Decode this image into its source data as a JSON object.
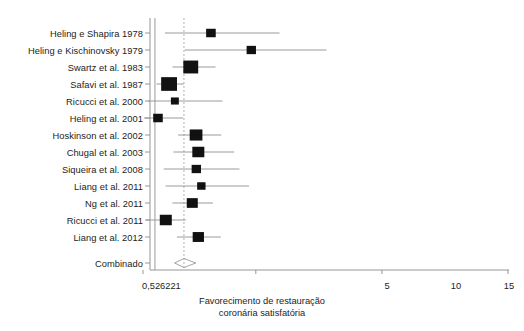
{
  "chart_data": {
    "type": "forest",
    "title": "",
    "xlabel": "Favorecimento de restauração coronária satisfatória",
    "ylabel": "",
    "xlim": [
      0.526221,
      15
    ],
    "xticks": [
      0.526221,
      5,
      10,
      15
    ],
    "xtick_labels": [
      "0,526221",
      "5",
      "10",
      "15"
    ],
    "grid": false,
    "legend": null,
    "null_line": 1,
    "summary_line": 2.15,
    "categories": [
      "Heling e Shapira 1978",
      "Heling e Kischinovsky 1979",
      "Swartz et al. 1983",
      "Safavi et al. 1987",
      "Ricucci et al. 2000",
      "Heling et al. 2001",
      "Hoskinson et al. 2002",
      "Chugal et al. 2003",
      "Siqueira et al. 2008",
      "Liang et al. 2011",
      "Ng et al. 2011",
      "Ricucci et al. 2011",
      "Liang et al. 2012",
      "Combinado"
    ],
    "studies": [
      {
        "label": "Heling e Shapira 1978",
        "estimate": 3.22,
        "ci_low": 1.4,
        "ci_high": 5.94,
        "weight": 0.3
      },
      {
        "label": "Heling e Kischinovsky 1979",
        "estimate": 4.82,
        "ci_low": 2.18,
        "ci_high": 7.8,
        "weight": 0.28
      },
      {
        "label": "Swartz et al. 1983",
        "estimate": 2.42,
        "ci_low": 1.7,
        "ci_high": 3.4,
        "weight": 0.74
      },
      {
        "label": "Safavi et al. 1987",
        "estimate": 1.56,
        "ci_low": 1.06,
        "ci_high": 2.14,
        "weight": 0.82
      },
      {
        "label": "Ricucci et al. 2000",
        "estimate": 1.79,
        "ci_low": 0.72,
        "ci_high": 3.68,
        "weight": 0.16
      },
      {
        "label": "Heling et al. 2001",
        "estimate": 1.12,
        "ci_low": 0.57,
        "ci_high": 2.12,
        "weight": 0.3
      },
      {
        "label": "Hoskinson et al. 2002",
        "estimate": 2.63,
        "ci_low": 1.92,
        "ci_high": 3.63,
        "weight": 0.56
      },
      {
        "label": "Chugal et al. 2003",
        "estimate": 2.72,
        "ci_low": 1.73,
        "ci_high": 4.14,
        "weight": 0.5
      },
      {
        "label": "Siqueira et al. 2008",
        "estimate": 2.64,
        "ci_low": 1.35,
        "ci_high": 4.35,
        "weight": 0.28
      },
      {
        "label": "Liang et al. 2011",
        "estimate": 2.84,
        "ci_low": 1.42,
        "ci_high": 4.73,
        "weight": 0.2
      },
      {
        "label": "Ng et al. 2011",
        "estimate": 2.48,
        "ci_low": 1.69,
        "ci_high": 3.3,
        "weight": 0.42
      },
      {
        "label": "Ricucci et al. 2011",
        "estimate": 1.43,
        "ci_low": 0.65,
        "ci_high": 2.22,
        "weight": 0.5
      },
      {
        "label": "Liang et al. 2012",
        "estimate": 2.72,
        "ci_low": 1.87,
        "ci_high": 3.61,
        "weight": 0.44
      }
    ],
    "summary": {
      "label": "Combinado",
      "estimate": 2.15,
      "ci_low": 1.78,
      "ci_high": 2.62
    }
  },
  "colors": {
    "marker": "#111111",
    "ci_line": "#9a9a9a",
    "axis": "#8a8a8a",
    "null_line": "#9a9a9a",
    "summary_line": "#b0b0b0",
    "text": "#1c1c1c",
    "background": "#ffffff"
  },
  "axis": {
    "caption_line1": "Favorecimento de restauração",
    "caption_line2": "coronária satisfatória",
    "ticks": [
      {
        "value": 0.526221,
        "label": "0,526221"
      },
      {
        "value": 5,
        "label": "5"
      },
      {
        "value": 10,
        "label": "10"
      },
      {
        "value": 15,
        "label": "15"
      }
    ]
  }
}
